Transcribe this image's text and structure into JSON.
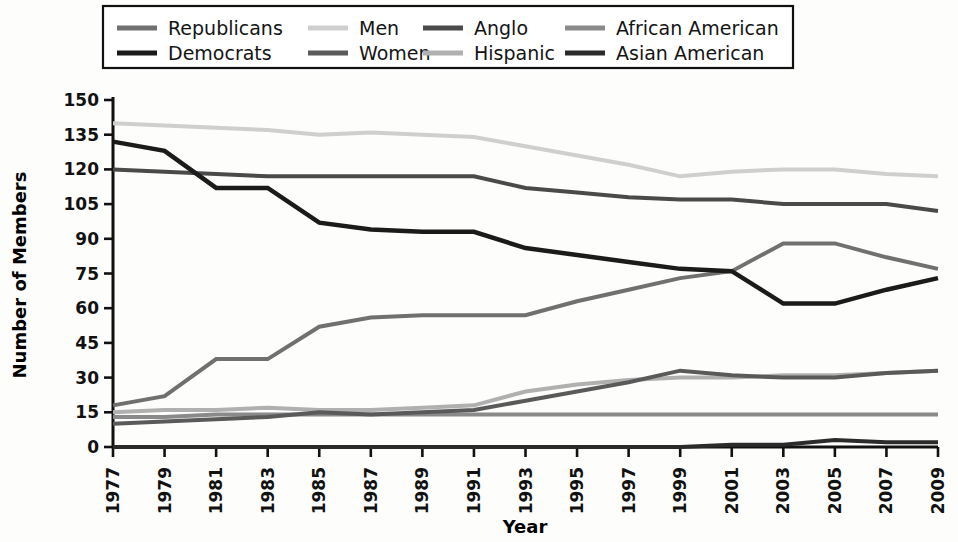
{
  "chart_data": {
    "type": "line",
    "title": "",
    "xlabel": "Year",
    "ylabel": "Number of Members",
    "x": [
      1977,
      1979,
      1981,
      1983,
      1985,
      1987,
      1989,
      1991,
      1993,
      1995,
      1997,
      1999,
      2001,
      2003,
      2005,
      2007,
      2009
    ],
    "xtick_labels": [
      "1977",
      "1979",
      "1981",
      "1983",
      "1985",
      "1987",
      "1989",
      "1991",
      "1993",
      "1995",
      "1997",
      "1999",
      "2001",
      "2003",
      "2005",
      "2007",
      "2009"
    ],
    "ytick_labels": [
      "0",
      "15",
      "30",
      "45",
      "60",
      "75",
      "90",
      "105",
      "120",
      "135",
      "150"
    ],
    "yticks": [
      0,
      15,
      30,
      45,
      60,
      75,
      90,
      105,
      120,
      135,
      150
    ],
    "ylim": [
      0,
      150
    ],
    "xlim": [
      1977,
      2009
    ],
    "grid": false,
    "legend_position": "top",
    "legend_columns": 4,
    "legend_rows": 2,
    "series": [
      {
        "name": "Republicans",
        "color": "#707070",
        "width": 4,
        "values": [
          18,
          22,
          38,
          38,
          52,
          56,
          57,
          57,
          57,
          63,
          68,
          73,
          76,
          88,
          88,
          82,
          77
        ]
      },
      {
        "name": "Democrats",
        "color": "#1b1b1b",
        "width": 4.5,
        "values": [
          132,
          128,
          112,
          112,
          97,
          94,
          93,
          93,
          86,
          83,
          80,
          77,
          76,
          62,
          62,
          68,
          73
        ]
      },
      {
        "name": "Men",
        "color": "#cfcfcf",
        "width": 4,
        "values": [
          140,
          139,
          138,
          137,
          135,
          136,
          135,
          134,
          130,
          126,
          122,
          117,
          119,
          120,
          120,
          118,
          117
        ]
      },
      {
        "name": "Women",
        "color": "#5a5a5a",
        "width": 4,
        "values": [
          10,
          11,
          12,
          13,
          15,
          14,
          15,
          16,
          20,
          24,
          28,
          33,
          31,
          30,
          30,
          32,
          33
        ]
      },
      {
        "name": "Anglo",
        "color": "#4a4a4a",
        "width": 4,
        "values": [
          120,
          119,
          118,
          117,
          117,
          117,
          117,
          117,
          112,
          110,
          108,
          107,
          107,
          105,
          105,
          105,
          102
        ]
      },
      {
        "name": "Hispanic",
        "color": "#b0b0b0",
        "width": 4,
        "values": [
          15,
          16,
          16,
          17,
          16,
          16,
          17,
          18,
          24,
          27,
          29,
          30,
          30,
          31,
          31,
          32,
          33
        ]
      },
      {
        "name": "African American",
        "color": "#8a8a8a",
        "width": 4,
        "values": [
          13,
          13,
          14,
          14,
          14,
          14,
          14,
          14,
          14,
          14,
          14,
          14,
          14,
          14,
          14,
          14,
          14
        ]
      },
      {
        "name": "Asian American",
        "color": "#2b2b2b",
        "width": 4,
        "values": [
          0,
          0,
          0,
          0,
          0,
          0,
          0,
          0,
          0,
          0,
          0,
          0,
          1,
          1,
          3,
          2,
          2
        ]
      }
    ]
  },
  "legend": {
    "entries": [
      {
        "label": "Republicans"
      },
      {
        "label": "Men"
      },
      {
        "label": "Anglo"
      },
      {
        "label": "African American"
      },
      {
        "label": "Democrats"
      },
      {
        "label": "Women"
      },
      {
        "label": "Hispanic"
      },
      {
        "label": "Asian American"
      }
    ]
  },
  "axes": {
    "y_title": "Number of Members",
    "x_title": "Year"
  }
}
